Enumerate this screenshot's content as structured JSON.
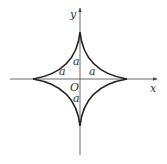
{
  "figure": {
    "type": "astroid",
    "axes": {
      "x_label": "x",
      "y_label": "y",
      "origin_label": "O"
    },
    "segment_labels": [
      "a",
      "a",
      "a",
      "a"
    ],
    "colors": {
      "curve": "#222222",
      "axis": "#444444",
      "text": "#333333"
    }
  }
}
